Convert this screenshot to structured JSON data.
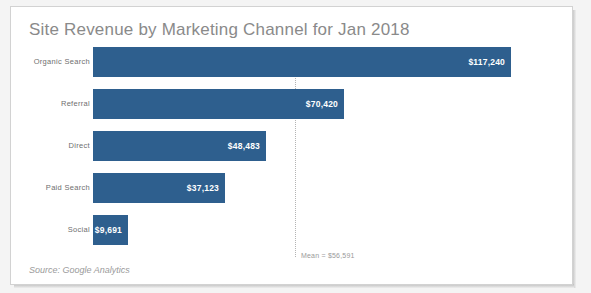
{
  "chart_data": {
    "type": "bar",
    "orientation": "horizontal",
    "title": "Site Revenue by Marketing Channel for Jan 2018",
    "xlabel": "",
    "ylabel": "",
    "categories": [
      "Organic Search",
      "Referral",
      "Direct",
      "Paid Search",
      "Social"
    ],
    "values": [
      117240,
      70420,
      48483,
      37123,
      9691
    ],
    "value_labels": [
      "$117,240",
      "$70,420",
      "$48,483",
      "$37,123",
      "$9,691"
    ],
    "xlim": [
      0,
      117240
    ],
    "grid": false,
    "legend": null,
    "annotations": [
      {
        "kind": "reference-line",
        "label": "Mean = $56,591",
        "value": 56591,
        "style": "dotted",
        "color": "#b4b4b4"
      }
    ],
    "source": "Source: Google Analytics",
    "bar_color": "#2e5f8e",
    "title_color": "#8a8a8a",
    "label_color": "#6f6f6f",
    "value_label_color": "#ffffff"
  },
  "chart": {
    "title": "Site Revenue by Marketing Channel for Jan 2018",
    "source": "Source: Google Analytics",
    "mean_label": "Mean = $56,591",
    "bars": [
      {
        "category": "Organic Search",
        "value_label": "$117,240"
      },
      {
        "category": "Referral",
        "value_label": "$70,420"
      },
      {
        "category": "Direct",
        "value_label": "$48,483"
      },
      {
        "category": "Paid Search",
        "value_label": "$37,123"
      },
      {
        "category": "Social",
        "value_label": "$9,691"
      }
    ]
  }
}
